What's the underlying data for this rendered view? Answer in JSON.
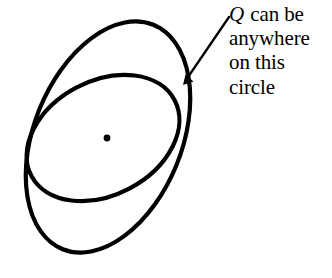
{
  "figure": {
    "background_color": "#ffffff",
    "stroke_color": "#000000",
    "width": 332,
    "height": 278,
    "annotation": {
      "variable_label": "Q",
      "line1_rest": " can be",
      "line2": "anywhere",
      "line3": "on this",
      "line4": "circle",
      "full_text": "Q can be anywhere on this circle"
    },
    "shapes": {
      "outer_ellipse": {
        "name": "outer-circle",
        "center_x": 108,
        "center_y": 137,
        "radius_x": 74,
        "radius_y": 121,
        "rotation_deg": 22,
        "stroke_width": 4.2
      },
      "inner_ellipse": {
        "name": "inner-circle",
        "center_x": 103,
        "center_y": 138,
        "radius_x": 81,
        "radius_y": 57,
        "rotation_deg": -28,
        "stroke_width": 4.2
      },
      "center_point": {
        "name": "center-dot",
        "x": 107,
        "y": 138,
        "radius": 3.4
      },
      "arrow": {
        "name": "annotation-arrow",
        "tail_x": 229,
        "tail_y": 17,
        "tip_x": 183,
        "tip_y": 85,
        "stroke_width": 2.3
      }
    }
  }
}
